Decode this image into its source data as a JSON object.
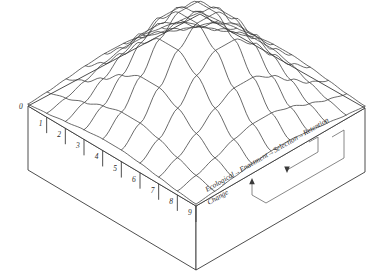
{
  "figure": {
    "kind": "3d-surface-box-diagram",
    "background": "#ffffff",
    "line_color": "#3a3a3a",
    "text_color": "#2b2b2b",
    "title": ""
  },
  "axis": {
    "name": "front-left-edge-scale",
    "ticks": [
      "0",
      "1",
      "2",
      "3",
      "4",
      "5",
      "6",
      "7",
      "8",
      "9"
    ]
  },
  "process": {
    "steps": [
      "Ecological",
      "Enactment",
      "Selection",
      "Retention"
    ],
    "sublabel": "Change",
    "arrow": "→",
    "chain": "Ecological→Enactment→Selection→Retention",
    "feedback_loop": true
  },
  "chart_data": {
    "type": "surface",
    "title": "",
    "xlabel": "",
    "ylabel": "",
    "grid": true,
    "legend": "none",
    "x_ticks": [
      "0",
      "1",
      "2",
      "3",
      "4",
      "5",
      "6",
      "7",
      "8",
      "9"
    ],
    "grid_cols": 10,
    "grid_rows": 10,
    "z_values": [
      [
        0.02,
        0.04,
        0.07,
        0.1,
        0.12,
        0.12,
        0.1,
        0.07,
        0.04,
        0.02
      ],
      [
        0.04,
        0.09,
        0.16,
        0.24,
        0.29,
        0.29,
        0.24,
        0.16,
        0.09,
        0.04
      ],
      [
        0.07,
        0.16,
        0.3,
        0.45,
        0.55,
        0.55,
        0.45,
        0.3,
        0.16,
        0.07
      ],
      [
        0.1,
        0.24,
        0.45,
        0.68,
        0.83,
        0.83,
        0.68,
        0.45,
        0.24,
        0.1
      ],
      [
        0.12,
        0.29,
        0.55,
        0.83,
        1.0,
        1.0,
        0.83,
        0.55,
        0.29,
        0.12
      ],
      [
        0.12,
        0.29,
        0.55,
        0.83,
        1.0,
        1.0,
        0.83,
        0.55,
        0.29,
        0.12
      ],
      [
        0.1,
        0.24,
        0.45,
        0.68,
        0.83,
        0.83,
        0.68,
        0.45,
        0.24,
        0.1
      ],
      [
        0.07,
        0.16,
        0.3,
        0.45,
        0.55,
        0.55,
        0.45,
        0.3,
        0.16,
        0.07
      ],
      [
        0.04,
        0.09,
        0.16,
        0.24,
        0.29,
        0.29,
        0.24,
        0.16,
        0.09,
        0.04
      ],
      [
        0.02,
        0.04,
        0.07,
        0.1,
        0.12,
        0.12,
        0.1,
        0.07,
        0.04,
        0.02
      ]
    ],
    "zlim": [
      0,
      1
    ]
  }
}
